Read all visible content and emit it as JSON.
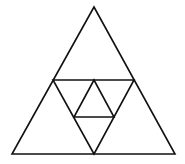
{
  "diagram": {
    "stroke_color": "#111111",
    "background_color": "#ffffff",
    "outer_triangle": {
      "points": [
        [
          94,
          7
        ],
        [
          12,
          154
        ],
        [
          175,
          154
        ]
      ]
    },
    "mid_triangle": {
      "points": [
        [
          53,
          80
        ],
        [
          134,
          80
        ],
        [
          94,
          154
        ]
      ]
    },
    "inner_triangle": {
      "points": [
        [
          94,
          80
        ],
        [
          74,
          117
        ],
        [
          114,
          117
        ]
      ]
    }
  }
}
